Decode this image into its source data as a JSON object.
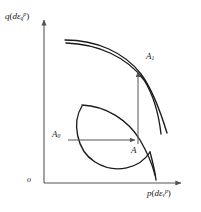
{
  "figure": {
    "title": "",
    "background": "#ffffff",
    "line_color": "#1a1a1a",
    "axis_color": "#555555",
    "arrow_color": "#555555"
  },
  "axes": {
    "origin_label": "o",
    "y": {
      "label_prefix": "q",
      "label_open": "(",
      "label_d": "d",
      "label_eps": "ε",
      "label_sub": "q",
      "label_sup": "p",
      "label_close": ")",
      "label_plain": "q(dεqᵖ)"
    },
    "x": {
      "label_prefix": "p",
      "label_open": "(",
      "label_d": "d",
      "label_eps": "ε",
      "label_sub": "v",
      "label_sup": "p",
      "label_close": ")",
      "label_plain": "p(dεvᵖ)"
    }
  },
  "points": [
    {
      "id": "A1",
      "letter": "A",
      "sub": "1",
      "x": 138,
      "y": 68
    },
    {
      "id": "A0",
      "letter": "A",
      "sub": "0",
      "x": 68,
      "y": 140
    },
    {
      "id": "A",
      "letter": "A",
      "sub": "",
      "x": 138,
      "y": 145
    }
  ],
  "arrows": [
    {
      "name": "A0-to-A",
      "from": [
        68,
        140
      ],
      "to": [
        136,
        140
      ]
    },
    {
      "name": "A-to-A1",
      "from": [
        138,
        144
      ],
      "to": [
        138,
        70
      ]
    }
  ],
  "curves": [
    {
      "name": "outer-yield-surface-1"
    },
    {
      "name": "outer-yield-surface-2"
    },
    {
      "name": "inner-yield-surface"
    },
    {
      "name": "cap-curve"
    },
    {
      "name": "critical-state-line"
    }
  ]
}
